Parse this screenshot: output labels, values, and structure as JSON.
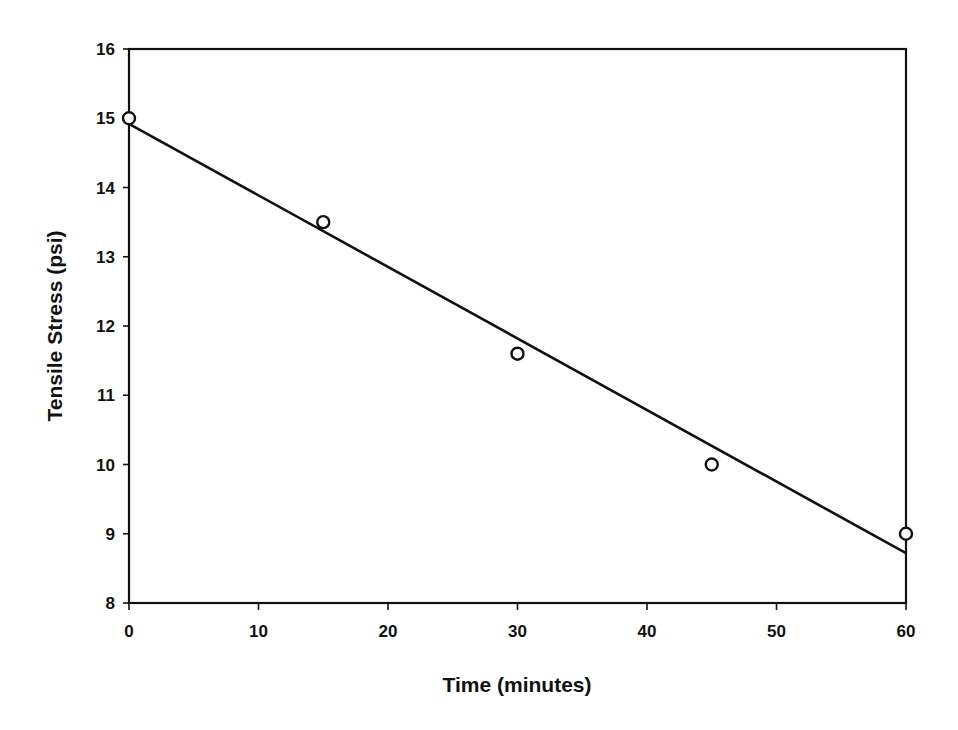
{
  "chart_data": {
    "type": "scatter",
    "title": "",
    "xlabel": "Time (minutes)",
    "ylabel": "Tensile Stress (psi)",
    "xlim": [
      0,
      60
    ],
    "ylim": [
      8,
      16
    ],
    "xticks": [
      0,
      10,
      20,
      30,
      40,
      50,
      60
    ],
    "yticks": [
      8,
      9,
      10,
      11,
      12,
      13,
      14,
      15,
      16
    ],
    "grid": false,
    "legend": null,
    "series": [
      {
        "name": "Measured",
        "kind": "scatter",
        "marker": "open-circle",
        "x": [
          0,
          15,
          30,
          45,
          60
        ],
        "y": [
          15.0,
          13.5,
          11.6,
          10.0,
          9.0
        ]
      },
      {
        "name": "Linear fit",
        "kind": "line",
        "x": [
          0,
          60
        ],
        "y": [
          14.92,
          8.72
        ]
      }
    ],
    "colors": {
      "axis": "#111111",
      "line": "#111111",
      "marker_edge": "#111111",
      "marker_fill": "#ffffff",
      "background": "#ffffff"
    }
  }
}
